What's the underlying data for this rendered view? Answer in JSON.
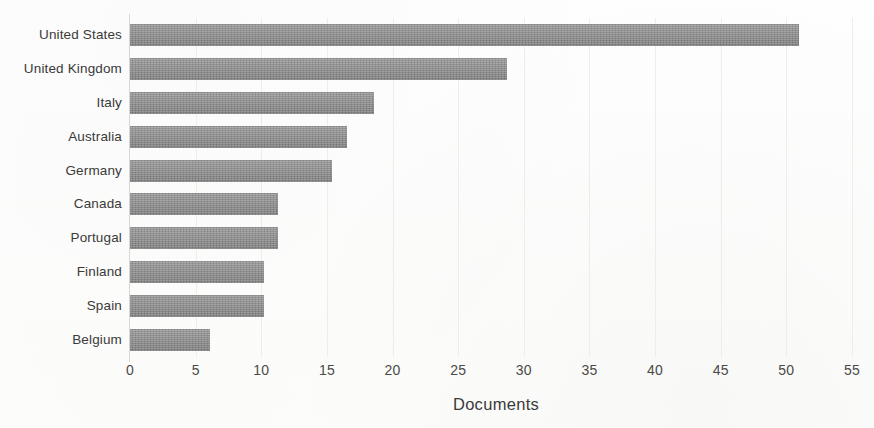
{
  "chart_data": {
    "type": "bar",
    "orientation": "horizontal",
    "title": "",
    "xlabel": "Documents",
    "ylabel": "",
    "categories": [
      "United States",
      "United Kingdom",
      "Italy",
      "Australia",
      "Germany",
      "Canada",
      "Portugal",
      "Finland",
      "Spain",
      "Belgium"
    ],
    "values": [
      51,
      28.7,
      18.6,
      16.5,
      15.4,
      11.3,
      11.3,
      10.2,
      10.2,
      6.1
    ],
    "xlim": [
      0,
      55
    ],
    "xticks": [
      0,
      5,
      10,
      15,
      20,
      25,
      30,
      35,
      40,
      45,
      50,
      55
    ],
    "xtick_labels": [
      "0",
      "5",
      "10",
      "15",
      "20",
      "25",
      "30",
      "35",
      "40",
      "45",
      "50",
      "55"
    ],
    "grid": "vertical-light",
    "legend": "none",
    "series": [
      {
        "name": "Documents",
        "color": "#8b8b8b",
        "values": [
          51,
          28.7,
          18.6,
          16.5,
          15.4,
          11.3,
          11.3,
          10.2,
          10.2,
          6.1
        ]
      }
    ],
    "bar_color": "#8b8b8b",
    "axis_color": "#d7d7d2",
    "grid_color": "#ededea",
    "text_color": "#3a3a38",
    "background_color": "#fdfdfc"
  }
}
